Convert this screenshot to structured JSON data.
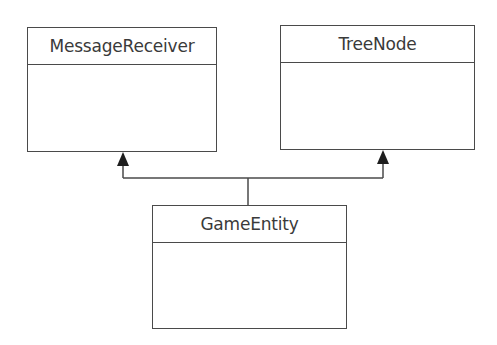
{
  "diagram": {
    "type": "uml-class-diagram",
    "classes": [
      {
        "id": "message-receiver",
        "name": "MessageReceiver"
      },
      {
        "id": "tree-node",
        "name": "TreeNode"
      },
      {
        "id": "game-entity",
        "name": "GameEntity"
      }
    ],
    "relationships": [
      {
        "type": "generalization",
        "from": "GameEntity",
        "to": "MessageReceiver"
      },
      {
        "type": "generalization",
        "from": "GameEntity",
        "to": "TreeNode"
      }
    ],
    "colors": {
      "line": "#4a4a4a",
      "text": "#3a3a3a",
      "background": "#ffffff"
    }
  }
}
